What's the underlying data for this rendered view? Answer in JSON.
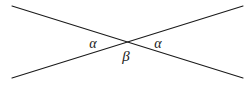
{
  "figure": {
    "name": "vertical-angles-diagram",
    "background_color": "#ffffff",
    "stroke_color": "#1a1a1a",
    "stroke_width": 1.1,
    "width": 251,
    "height": 85
  },
  "labels": {
    "alpha_left": "α",
    "alpha_right": "α",
    "beta_bottom": "β"
  },
  "label_positions": {
    "alpha_left": {
      "x": 93,
      "y": 44
    },
    "alpha_right": {
      "x": 158,
      "y": 44
    },
    "beta_bottom": {
      "x": 126,
      "y": 56
    }
  },
  "chart_data": {
    "type": "line",
    "title": "",
    "xlabel": "",
    "ylabel": "",
    "grid": false,
    "legend": "none",
    "xlim": [
      0,
      251
    ],
    "ylim": [
      0,
      85
    ],
    "annotations": [
      {
        "text": "α",
        "x": 93,
        "y": 44
      },
      {
        "text": "α",
        "x": 158,
        "y": 44
      },
      {
        "text": "β",
        "x": 126,
        "y": 56
      }
    ],
    "series": [
      {
        "name": "line-descending",
        "x": [
          12,
          243
        ],
        "y": [
          6,
          78
        ]
      },
      {
        "name": "line-ascending",
        "x": [
          12,
          243
        ],
        "y": [
          78,
          6
        ]
      }
    ],
    "intersection": {
      "x": 127,
      "y": 42
    }
  }
}
